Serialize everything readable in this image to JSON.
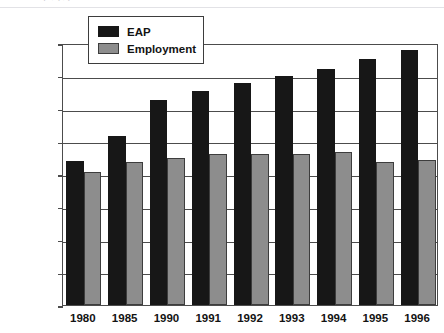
{
  "figure": {
    "clipped_caption": "t  p   ,  ( , )",
    "background_color": "#ffffff"
  },
  "legend": {
    "position": "top-left-inside",
    "entries": [
      {
        "label": "EAP",
        "color": "#171717",
        "swatch_name": "legend-swatch-eap"
      },
      {
        "label": "Employment",
        "color": "#8d8d8d",
        "swatch_name": "legend-swatch-employment"
      }
    ]
  },
  "chart_data": {
    "type": "bar",
    "title": "",
    "xlabel": "",
    "ylabel": "",
    "categories": [
      "1980",
      "1985",
      "1990",
      "1991",
      "1992",
      "1993",
      "1994",
      "1995",
      "1996"
    ],
    "series": [
      {
        "name": "EAP",
        "color": "#171717",
        "values": [
          22000,
          25800,
          31300,
          32600,
          33900,
          35000,
          36100,
          37500,
          38900
        ]
      },
      {
        "name": "Employment",
        "color": "#8d8d8d",
        "values": [
          20300,
          21900,
          22400,
          23000,
          23100,
          23100,
          23400,
          21900,
          22100
        ]
      }
    ],
    "ylim": [
      0,
      40000
    ],
    "yticks": [
      0,
      5000,
      10000,
      15000,
      20000,
      25000,
      30000,
      35000,
      40000
    ],
    "ytick_labels": [
      "0",
      "5,000",
      "10,000",
      "15,000",
      "20,000",
      "25,000",
      "30,000",
      "35,000",
      "40,000"
    ],
    "grid": true,
    "grid_axis": "y",
    "legend_position": "upper left"
  }
}
